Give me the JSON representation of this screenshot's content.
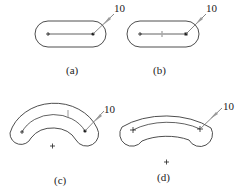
{
  "figure": {
    "panels": [
      {
        "id": "a",
        "caption": "(a)",
        "dimension_label": "10",
        "shape": "straight-slot"
      },
      {
        "id": "b",
        "caption": "(b)",
        "dimension_label": "10",
        "shape": "straight-slot-with-midpoint"
      },
      {
        "id": "c",
        "caption": "(c)",
        "dimension_label": "10",
        "shape": "arc-slot"
      },
      {
        "id": "d",
        "caption": "(d)",
        "dimension_label": "10",
        "shape": "arc-slot-wide"
      }
    ],
    "colors": {
      "stroke": "#3a3a3a",
      "leader": "#6a6a6a",
      "arrow": "#9a9a9a"
    }
  }
}
